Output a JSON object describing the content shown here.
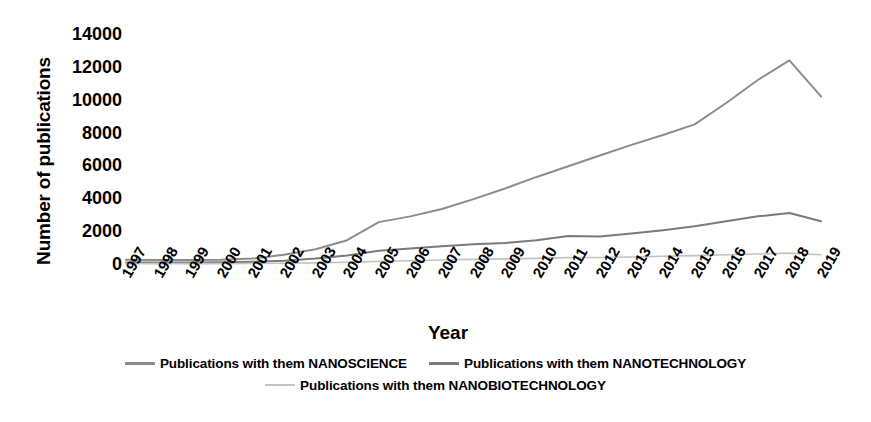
{
  "chart_data": {
    "type": "line",
    "title": "",
    "xlabel": "Year",
    "ylabel": "Number of publications",
    "ylim": [
      0,
      14000
    ],
    "ytick_values": [
      14000,
      12000,
      10000,
      8000,
      6000,
      4000,
      2000,
      0
    ],
    "ytick_labels": [
      "14000",
      "12000",
      "10000",
      "8000",
      "6000",
      "4000",
      "2000",
      "0"
    ],
    "grid": false,
    "legend_position": "bottom",
    "categories": [
      "1997",
      "1998",
      "1999",
      "2000",
      "2001",
      "2002",
      "2003",
      "2004",
      "2005",
      "2006",
      "2007",
      "2008",
      "2009",
      "2010",
      "2011",
      "2012",
      "2013",
      "2014",
      "2015",
      "2016",
      "2017",
      "2018",
      "2019"
    ],
    "series": [
      {
        "name": "Publications with them NANOSCIENCE",
        "color": "#8c8c8c",
        "values": [
          260,
          250,
          250,
          260,
          330,
          560,
          900,
          1450,
          2550,
          2900,
          3350,
          3950,
          4600,
          5300,
          5950,
          6600,
          7250,
          7850,
          8500,
          9800,
          11200,
          12400,
          10200
        ]
      },
      {
        "name": "Publications with them NANOTECHNOLOGY",
        "color": "#7a7a7a",
        "values": [
          90,
          90,
          95,
          100,
          130,
          200,
          330,
          520,
          800,
          950,
          1080,
          1200,
          1280,
          1450,
          1700,
          1680,
          1850,
          2050,
          2300,
          2600,
          2900,
          3100,
          2600
        ]
      },
      {
        "name": "Publications with them NANOBIOTECHNOLOGY",
        "color": "#c2c2c2",
        "values": [
          20,
          20,
          20,
          25,
          30,
          45,
          70,
          110,
          160,
          200,
          240,
          280,
          310,
          340,
          390,
          400,
          430,
          470,
          510,
          560,
          610,
          660,
          560
        ]
      }
    ]
  }
}
